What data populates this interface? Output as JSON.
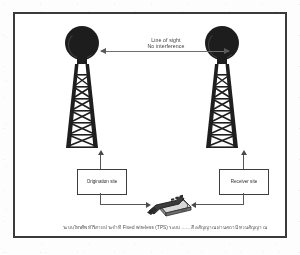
{
  "figure": {
    "link_label_line1": "Line of sight",
    "link_label_line2": "No interference",
    "origination_box": "Origination site",
    "receiver_box": "Receiver site",
    "caption": "ระบบโทรศัพท์ไร้สายประจำที่ Fixed wireless (TPS) ระบบ ...... สื่อสัญญาณผ่านสถานีทวนสัญญาณ",
    "icons": {
      "left_tower": "microwave-tower-icon",
      "right_tower": "microwave-tower-icon",
      "left_dish": "parabolic-dish-icon",
      "right_dish": "parabolic-dish-icon",
      "phone": "desk-telephone-icon"
    }
  }
}
